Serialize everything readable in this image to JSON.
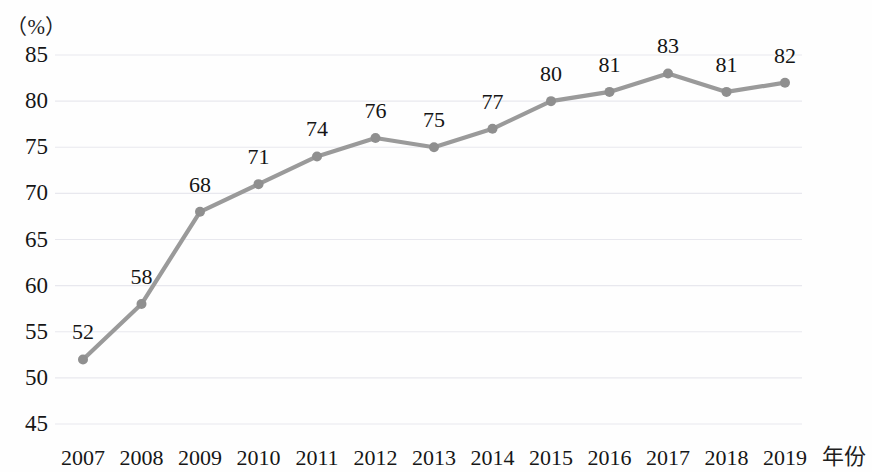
{
  "axes": {
    "unit_label": "（%）",
    "x_axis_title": "年份",
    "y_ticks": [
      "85",
      "80",
      "75",
      "70",
      "65",
      "60",
      "55",
      "50",
      "45"
    ],
    "x_ticks": [
      "2007",
      "2008",
      "2009",
      "2010",
      "2011",
      "2012",
      "2013",
      "2014",
      "2015",
      "2016",
      "2017",
      "2018",
      "2019"
    ]
  },
  "style": {
    "line_color": "#9a9a9a",
    "marker_color": "#8f8f8f",
    "gridline_color": "#e8e8ee",
    "text_color": "#161616",
    "background": "#fefefe"
  },
  "chart_data": {
    "type": "line",
    "title": "",
    "subtitle": "",
    "xlabel": "年份",
    "ylabel": "（%）",
    "categories": [
      "2007",
      "2008",
      "2009",
      "2010",
      "2011",
      "2012",
      "2013",
      "2014",
      "2015",
      "2016",
      "2017",
      "2018",
      "2019"
    ],
    "values": [
      52,
      58,
      68,
      71,
      74,
      76,
      75,
      77,
      80,
      81,
      83,
      81,
      82
    ],
    "data_labels": [
      "52",
      "58",
      "68",
      "71",
      "74",
      "76",
      "75",
      "77",
      "80",
      "81",
      "83",
      "81",
      "82"
    ],
    "ylim": [
      45,
      85
    ],
    "ytick_values": [
      85,
      80,
      75,
      70,
      65,
      60,
      55,
      50,
      45
    ],
    "ytick_step": 5,
    "grid": true,
    "grid_axis": "y",
    "legend": false,
    "legend_position": "none",
    "markers": true,
    "series": [
      {
        "name": "",
        "values": [
          52,
          58,
          68,
          71,
          74,
          76,
          75,
          77,
          80,
          81,
          83,
          81,
          82
        ]
      }
    ]
  }
}
